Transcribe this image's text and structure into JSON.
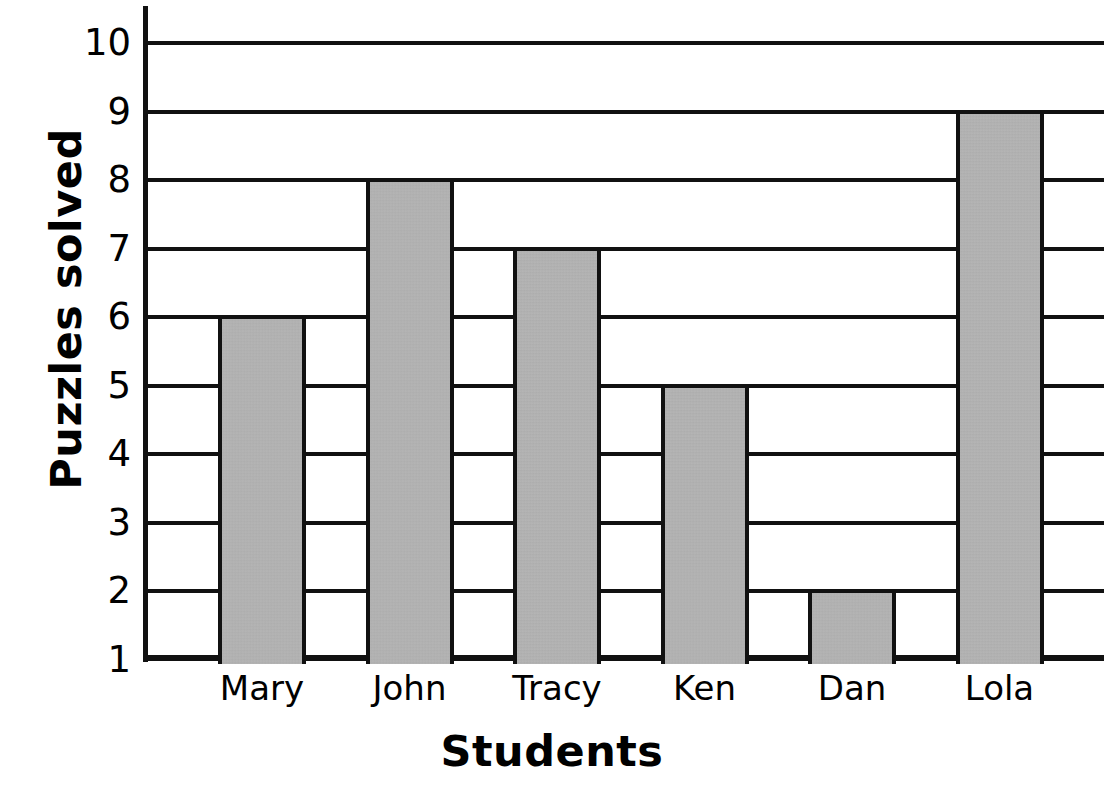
{
  "chart_data": {
    "type": "bar",
    "title": "",
    "subtitle": "",
    "xlabel": "Students",
    "ylabel": "Puzzles solved",
    "categories": [
      "Mary",
      "John",
      "Tracy",
      "Ken",
      "Dan",
      "Lola"
    ],
    "values": [
      6,
      8,
      7,
      5,
      2,
      9
    ],
    "series": [
      {
        "name": "Puzzles solved",
        "values": [
          6,
          8,
          7,
          5,
          2,
          9
        ]
      }
    ],
    "ylim": [
      1,
      10
    ],
    "y_ticks": [
      1,
      2,
      3,
      4,
      5,
      6,
      7,
      8,
      9,
      10
    ],
    "y_tick_labels": [
      "1",
      "2",
      "3",
      "4",
      "5",
      "6",
      "7",
      "8",
      "9",
      "10"
    ],
    "grid": true,
    "grid_axis": "y",
    "legend": false,
    "legend_position": "none",
    "annotations": [],
    "bar_fill_color": "#b4b4b4",
    "bar_edge_color": "#111111",
    "axis_color": "#111111",
    "background_color": "#ffffff"
  },
  "axes": {
    "y_title": "Puzzles solved",
    "x_title": "Students"
  }
}
